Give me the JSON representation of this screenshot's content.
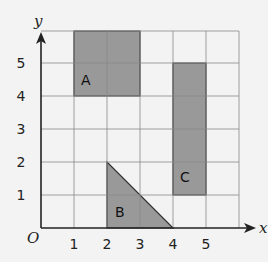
{
  "diagram": {
    "type": "coordinate-grid",
    "axes": {
      "x_label": "x",
      "y_label": "y",
      "origin_label": "O"
    },
    "x_ticks": [
      "1",
      "2",
      "3",
      "4",
      "5"
    ],
    "y_ticks": [
      "1",
      "2",
      "3",
      "4",
      "5"
    ],
    "grid": {
      "x_range": [
        0,
        6
      ],
      "y_range": [
        0,
        6
      ]
    },
    "shapes": [
      {
        "label": "A",
        "kind": "rectangle",
        "vertices": [
          [
            1,
            4
          ],
          [
            3,
            4
          ],
          [
            3,
            6
          ],
          [
            1,
            6
          ]
        ]
      },
      {
        "label": "B",
        "kind": "right-triangle",
        "vertices": [
          [
            2,
            0
          ],
          [
            4,
            0
          ],
          [
            2,
            2
          ]
        ]
      },
      {
        "label": "C",
        "kind": "rectangle",
        "vertices": [
          [
            4,
            1
          ],
          [
            5,
            1
          ],
          [
            5,
            5
          ],
          [
            4,
            5
          ]
        ]
      }
    ],
    "colors": {
      "fill": "#999999",
      "grid": "#888888",
      "axis": "#222222",
      "background": "#f3f3f3"
    }
  }
}
